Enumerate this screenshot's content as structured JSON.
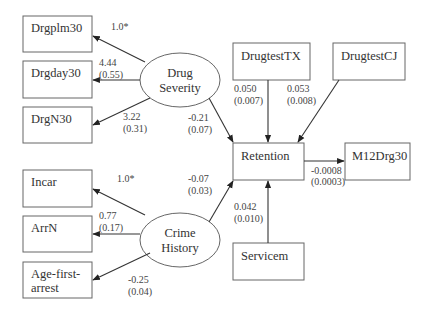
{
  "diagram": {
    "indicators_drug": [
      {
        "id": "drgplm30",
        "label": "Drgplm30",
        "loading": "1.0*",
        "se": ""
      },
      {
        "id": "drgday30",
        "label": "Drgday30",
        "loading": "4.44",
        "se": "(0.55)"
      },
      {
        "id": "drgn30",
        "label": "DrgN30",
        "loading": "3.22",
        "se": "(0.31)"
      }
    ],
    "indicators_crime": [
      {
        "id": "incar",
        "label": "Incar",
        "loading": "1.0*",
        "se": ""
      },
      {
        "id": "arrn",
        "label": "ArrN",
        "loading": "0.77",
        "se": "(0.17)"
      },
      {
        "id": "age_first_arrest",
        "label_line1": "Age-first-",
        "label_line2": "arrest",
        "loading": "-0.25",
        "se": "(0.04)"
      }
    ],
    "latent": {
      "drug_severity": {
        "line1": "Drug",
        "line2": "Severity"
      },
      "crime_history": {
        "line1": "Crime",
        "line2": "History"
      }
    },
    "observed": {
      "drugtesttx": "DrugtestTX",
      "drugtestcj": "DrugtestCJ",
      "retention": "Retention",
      "m12drg30": "M12Drg30",
      "servicem": "Servicem"
    },
    "paths": {
      "drug_to_retention": {
        "coef": "-0.21",
        "se": "(0.07)"
      },
      "crime_to_retention": {
        "coef": "-0.07",
        "se": "(0.03)"
      },
      "drugtesttx_to_retention": {
        "coef": "0.050",
        "se": "(0.007)"
      },
      "drugtestcj_to_retention": {
        "coef": "0.053",
        "se": "(0.008)"
      },
      "servicem_to_retention": {
        "coef": "0.042",
        "se": "(0.010)"
      },
      "retention_to_m12drg30": {
        "coef": "-0.0008",
        "se": "(0.0003)"
      }
    }
  }
}
